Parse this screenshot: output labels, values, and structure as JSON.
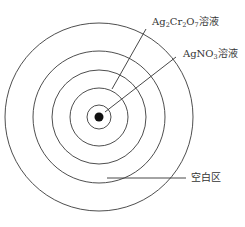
{
  "diagram": {
    "title": "",
    "center": {
      "x": 99,
      "y": 117
    },
    "center_dot": {
      "r": 4.5,
      "color": "#111111"
    },
    "rings": [
      {
        "name": "ring-1",
        "r": 12
      },
      {
        "name": "ring-2",
        "r": 29
      },
      {
        "name": "ring-3",
        "r": 47
      },
      {
        "name": "ring-4",
        "r": 66
      },
      {
        "name": "ring-5",
        "r": 94
      }
    ],
    "labels": {
      "ag2cr2o7": {
        "parts": [
          "Ag",
          "2",
          "Cr",
          "2",
          "O",
          "7",
          "溶液"
        ],
        "text": "Ag2Cr2O7溶液"
      },
      "agno3": {
        "parts": [
          "AgNO",
          "3",
          "溶液"
        ],
        "text": "AgNO3溶液"
      },
      "blank_zone": {
        "text": "空白区"
      }
    },
    "stroke_color": "#3a3a3a",
    "background": "#ffffff"
  }
}
